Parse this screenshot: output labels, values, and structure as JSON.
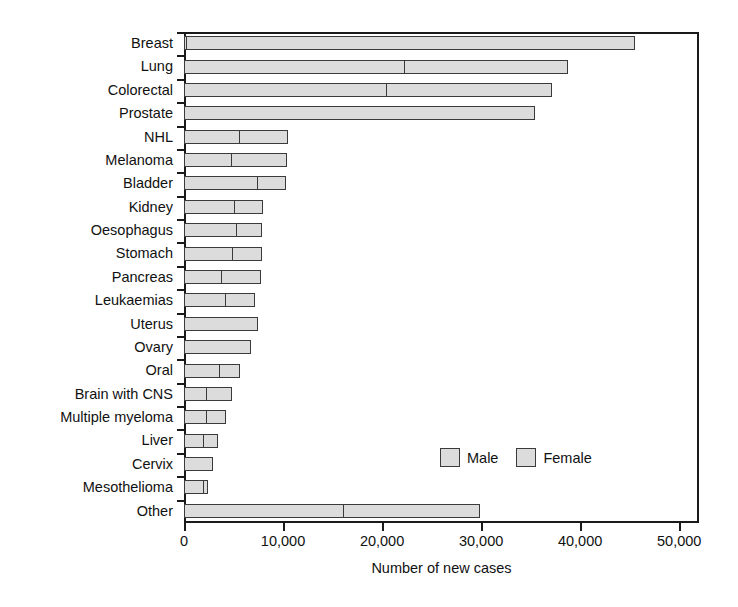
{
  "chart_data": {
    "type": "bar",
    "orientation": "horizontal",
    "stacked": true,
    "title": "",
    "xlabel": "Number of new cases",
    "ylabel": "",
    "xlim": [
      0,
      52000
    ],
    "xticks": [
      0,
      10000,
      20000,
      30000,
      40000,
      50000
    ],
    "xticklabels": [
      "0",
      "10,000",
      "20,000",
      "30,000",
      "40,000",
      "50,000"
    ],
    "grid": false,
    "legend_position": "inside-lower-right",
    "categories": [
      "Breast",
      "Lung",
      "Colorectal",
      "Prostate",
      "NHL",
      "Melanoma",
      "Bladder",
      "Kidney",
      "Oesophagus",
      "Stomach",
      "Pancreas",
      "Leukaemias",
      "Uterus",
      "Ovary",
      "Oral",
      "Brain with CNS",
      "Multiple myeloma",
      "Liver",
      "Cervix",
      "Mesothelioma",
      "Other"
    ],
    "series": [
      {
        "name": "Male",
        "color": "#dcdcdc",
        "values": [
          300,
          22300,
          20500,
          35400,
          5700,
          4800,
          7500,
          5100,
          5400,
          4900,
          3800,
          4200,
          0,
          0,
          3600,
          2300,
          2300,
          2000,
          0,
          2000,
          16200
        ]
      },
      {
        "name": "Female",
        "color": "#dcdcdc",
        "values": [
          45200,
          16500,
          16700,
          0,
          4800,
          5600,
          2800,
          2900,
          2500,
          3000,
          4000,
          3000,
          7500,
          6800,
          2100,
          2500,
          1900,
          1400,
          2900,
          400,
          13700
        ]
      }
    ],
    "totals": [
      45500,
      38800,
      37200,
      35400,
      10500,
      10400,
      10300,
      8000,
      7900,
      7900,
      7800,
      7200,
      7500,
      6800,
      5700,
      4800,
      4200,
      3400,
      2900,
      2400,
      29900
    ]
  },
  "legend": {
    "items": [
      {
        "label": "Male"
      },
      {
        "label": "Female"
      }
    ]
  }
}
